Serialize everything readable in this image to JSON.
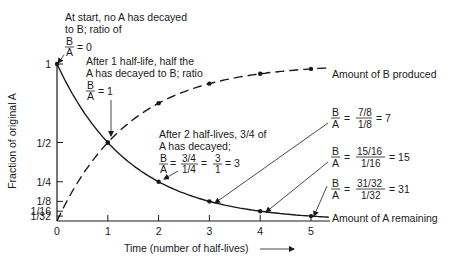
{
  "chart_data": {
    "type": "line",
    "title": "",
    "xlabel": "Time (number of half-lives)",
    "ylabel": "Fraction of original A",
    "xlim": [
      0,
      5
    ],
    "ylim": [
      0,
      1
    ],
    "x_ticks": [
      "0",
      "1",
      "2",
      "3",
      "4",
      "5"
    ],
    "y_ticks": [
      {
        "value": 1,
        "label": "1"
      },
      {
        "value": 0.5,
        "label": "1/2"
      },
      {
        "value": 0.25,
        "label": "1/4"
      },
      {
        "value": 0.125,
        "label": "1/8"
      },
      {
        "value": 0.0625,
        "label": "1/16"
      },
      {
        "value": 0.03125,
        "label": "1/32"
      }
    ],
    "x": [
      0,
      1,
      2,
      3,
      4,
      5
    ],
    "series": [
      {
        "name": "Amount of A remaining",
        "style": "solid",
        "values": [
          1,
          0.5,
          0.25,
          0.125,
          0.0625,
          0.03125
        ]
      },
      {
        "name": "Amount of B produced",
        "style": "dashed",
        "values": [
          0,
          0.5,
          0.75,
          0.875,
          0.9375,
          0.96875
        ]
      }
    ],
    "grid": false,
    "annotations": {
      "start": {
        "lines": [
          "At start, no A has decayed",
          "to B; ratio of"
        ],
        "ratio_num": "B",
        "ratio_den": "A",
        "ratio_value": "= 0"
      },
      "one_half_life": {
        "lines": [
          "After 1 half-life, half the",
          "A has decayed to B; ratio"
        ],
        "ratio_num": "B",
        "ratio_den": "A",
        "ratio_value": "= 1"
      },
      "two_half_lives": {
        "lines": [
          "After 2 half-lives, 3/4 of",
          "A has decayed;"
        ],
        "ratio_num": "B",
        "ratio_den": "A",
        "eq1_num": "3/4",
        "eq1_den": "1/4",
        "eq2_num": "3",
        "eq2_den": "1",
        "result": "= 3"
      },
      "three_half_lives": {
        "ratio_num": "B",
        "ratio_den": "A",
        "eq_num": "7/8",
        "eq_den": "1/8",
        "result": "= 7"
      },
      "four_half_lives": {
        "ratio_num": "B",
        "ratio_den": "A",
        "eq_num": "15/16",
        "eq_den": "1/16",
        "result": "= 15"
      },
      "five_half_lives": {
        "ratio_num": "B",
        "ratio_den": "A",
        "eq_num": "31/32",
        "eq_den": "1/32",
        "result": "= 31"
      }
    },
    "equals": "=",
    "xlabel_arrow": "→"
  }
}
